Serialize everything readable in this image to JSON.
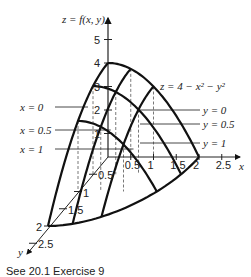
{
  "figure": {
    "surface_equation": "z = 4 − x² − y²",
    "z_axis_label": "z = f(x, y)",
    "x_axis_label": "x",
    "y_axis_label": "y",
    "z_ticks": [
      "1",
      "2",
      "3",
      "4",
      "5"
    ],
    "x_ticks": [
      "0.5",
      "1",
      "1.5",
      "2",
      "2.5"
    ],
    "y_ticks": [
      "0.5",
      "1",
      "1.5",
      "2",
      "2.5"
    ],
    "x_slice_labels": [
      "x = 0",
      "x = 0.5",
      "x = 1"
    ],
    "y_slice_labels": [
      "y = 0",
      "y = 0.5",
      "y = 1"
    ],
    "caption": "See 20.1  Exercise 9",
    "grid_values": [
      0,
      0.5,
      1
    ],
    "line_color": "#111111"
  }
}
